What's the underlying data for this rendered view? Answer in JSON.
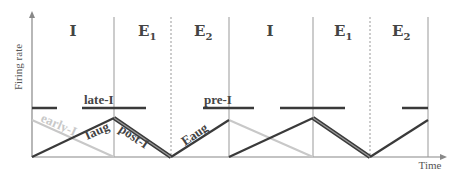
{
  "axes": {
    "y_label": "Firing rate",
    "x_label": "Time"
  },
  "phases": [
    {
      "label": "I",
      "sub": ""
    },
    {
      "label": "E",
      "sub": "1"
    },
    {
      "label": "E",
      "sub": "2"
    },
    {
      "label": "I",
      "sub": ""
    },
    {
      "label": "E",
      "sub": "1"
    },
    {
      "label": "E",
      "sub": "2"
    }
  ],
  "curves": {
    "late_i": "late-I",
    "pre_i": "pre-I",
    "early_i": "early-I",
    "iaug": "Iaug",
    "post_i": "post-I",
    "eaug": "Eaug"
  },
  "colors": {
    "axis": "#888888",
    "divider": "#999999",
    "dark_line": "#3a3a3a",
    "light_line": "#c8c8c8",
    "label": "#444444"
  }
}
